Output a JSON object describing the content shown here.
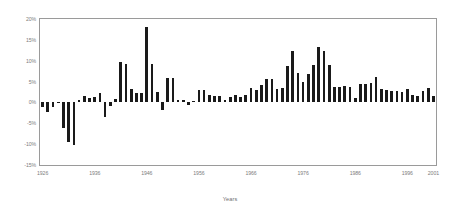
{
  "chart_data": {
    "type": "bar",
    "title": "",
    "subtitle": "",
    "xlabel": "Years",
    "ylabel": "",
    "grid": false,
    "legend": null,
    "ylim": [
      -15,
      20
    ],
    "ytick_labels": [
      "20%",
      "15%",
      "10%",
      "5%",
      "0%",
      "-5%",
      "-10%",
      "-15%"
    ],
    "ytick_values": [
      20,
      15,
      10,
      5,
      0,
      -5,
      -10,
      -15
    ],
    "xtick_labels": [
      "1926",
      "1936",
      "1946",
      "1956",
      "1966",
      "1976",
      "1986",
      "1996",
      "2001"
    ],
    "xtick_values": [
      1926,
      1936,
      1946,
      1956,
      1966,
      1976,
      1986,
      1996,
      2001
    ],
    "xlim": [
      1925.5,
      2001.5
    ],
    "bar_color": "#1a1a1a",
    "axis_color": "#9a9a9a",
    "categories": [
      1926,
      1927,
      1928,
      1929,
      1930,
      1931,
      1932,
      1933,
      1934,
      1935,
      1936,
      1937,
      1938,
      1939,
      1940,
      1941,
      1942,
      1943,
      1944,
      1945,
      1946,
      1947,
      1948,
      1949,
      1950,
      1951,
      1952,
      1953,
      1954,
      1955,
      1956,
      1957,
      1958,
      1959,
      1960,
      1961,
      1962,
      1963,
      1964,
      1965,
      1966,
      1967,
      1968,
      1969,
      1970,
      1971,
      1972,
      1973,
      1974,
      1975,
      1976,
      1977,
      1978,
      1979,
      1980,
      1981,
      1982,
      1983,
      1984,
      1985,
      1986,
      1987,
      1988,
      1989,
      1990,
      1991,
      1992,
      1993,
      1994,
      1995,
      1996,
      1997,
      1998,
      1999,
      2000,
      2001
    ],
    "values": [
      -1.1,
      -2.3,
      -1.2,
      0.2,
      -6.1,
      -9.6,
      -10.2,
      0.6,
      1.6,
      1.1,
      1.2,
      2.2,
      -3.5,
      -0.8,
      0.9,
      9.7,
      9.2,
      3.1,
      2.3,
      2.3,
      18.2,
      9.1,
      2.6,
      -1.8,
      5.8,
      5.9,
      0.7,
      0.6,
      -0.5,
      0.4,
      2.9,
      3.0,
      1.8,
      1.5,
      1.5,
      0.7,
      1.2,
      1.7,
      1.2,
      1.9,
      3.4,
      3.0,
      4.2,
      5.5,
      5.6,
      3.3,
      3.4,
      8.7,
      12.3,
      7.0,
      4.8,
      6.7,
      9.0,
      13.3,
      12.4,
      8.9,
      3.8,
      3.8,
      4.0,
      3.8,
      1.1,
      4.4,
      4.4,
      4.6,
      6.1,
      3.1,
      2.9,
      2.7,
      2.7,
      2.5,
      3.3,
      1.7,
      1.6,
      2.7,
      3.4,
      1.6
    ],
    "value_unit": "%",
    "n_bars": 76
  }
}
